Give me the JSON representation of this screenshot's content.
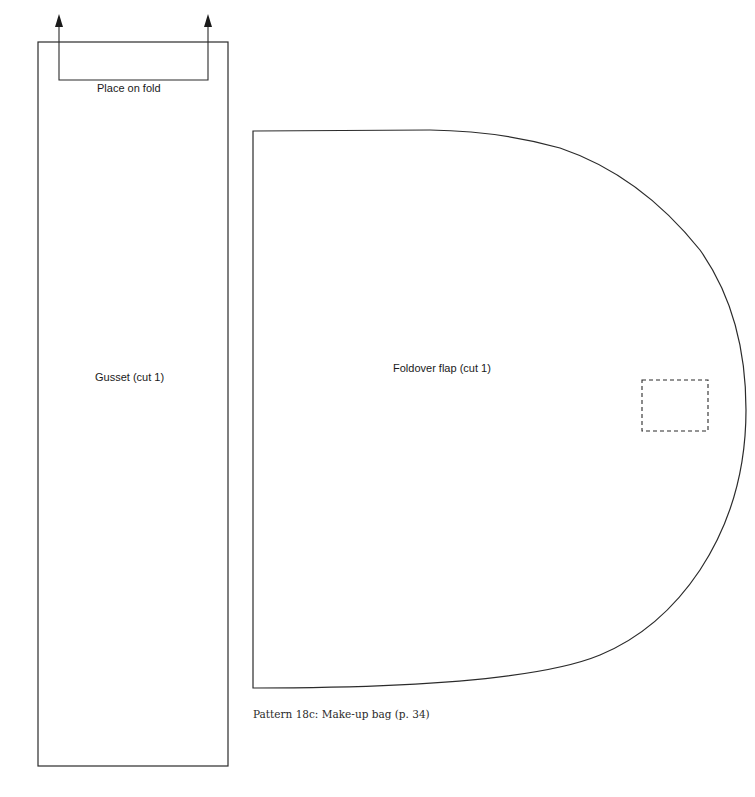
{
  "pattern": {
    "caption": "Pattern 18c: Make-up bag (p. 34)",
    "colors": {
      "line": "#2b2b2b",
      "background": "#ffffff"
    }
  },
  "gusset": {
    "label": "Gusset (cut 1)",
    "fold_label": "Place on fold",
    "icons": [
      "arrow-up-icon",
      "arrow-up-icon"
    ]
  },
  "flap": {
    "label": "Foldover flap (cut 1)",
    "marker": "dashed-placement-rectangle"
  }
}
